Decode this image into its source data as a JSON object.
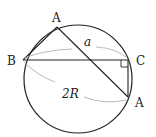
{
  "diagram": {
    "points": {
      "A_top": {
        "label": "A",
        "x": 57,
        "y": 27
      },
      "B": {
        "label": "B",
        "x": 23,
        "y": 60
      },
      "C": {
        "label": "C",
        "x": 128,
        "y": 60
      },
      "A_bottom": {
        "label": "A",
        "x": 128,
        "y": 97
      }
    },
    "labels": {
      "side_a": "a",
      "diameter": "2R"
    },
    "circle": {
      "cx": 78,
      "cy": 79,
      "r": 54
    },
    "colors": {
      "line": "#222222",
      "annotation": "#aaaaaa"
    }
  }
}
